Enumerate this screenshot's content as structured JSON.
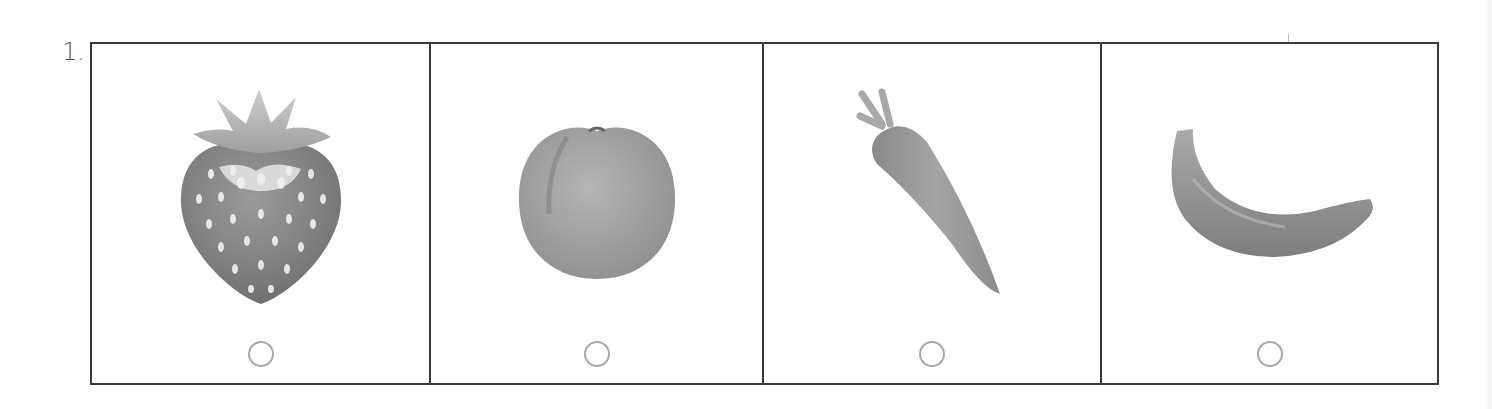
{
  "question": {
    "number_label": "1.",
    "options": [
      {
        "id": "strawberry",
        "picture": "strawberry-image",
        "selected": false
      },
      {
        "id": "peach",
        "picture": "peach-image",
        "selected": false
      },
      {
        "id": "carrot",
        "picture": "carrot-image",
        "selected": false
      },
      {
        "id": "banana",
        "picture": "banana-image",
        "selected": false
      }
    ]
  },
  "colors": {
    "border": "#3a3a3a",
    "radio_border": "#a8a8a8",
    "number_text": "#555555"
  }
}
